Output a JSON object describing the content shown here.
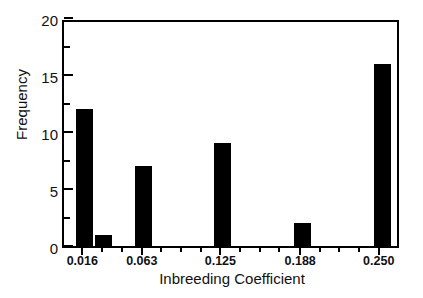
{
  "chart_data": {
    "type": "bar",
    "title": "",
    "xlabel": "Inbreeding Coefficient",
    "ylabel": "Frequency",
    "categories": [
      "0.016",
      "0.031",
      "0.063",
      "0.125",
      "0.188",
      "0.250"
    ],
    "values": [
      12,
      1,
      7,
      9,
      2,
      16
    ],
    "x": [
      0.016,
      0.031,
      0.063,
      0.125,
      0.188,
      0.25
    ],
    "bar_color": "#000000",
    "background_color": "#ffffff",
    "grid": false,
    "legend": "none",
    "xlim": [
      0.0,
      0.266
    ],
    "ylim": [
      0,
      20
    ],
    "y_ticks": [
      0,
      5,
      10,
      15,
      20
    ],
    "y_tick_labels": [
      "0",
      "5",
      "10",
      "15",
      "20"
    ],
    "y_minor_ticks": [
      2.5,
      7.5,
      12.5,
      17.5
    ],
    "x_ticks": [
      0.016,
      0.063,
      0.125,
      0.188,
      0.25
    ],
    "x_tick_labels": [
      "0.016",
      "0.063",
      "0.125",
      "0.188",
      "0.250"
    ],
    "x_minor_ticks": [
      0.0315,
      0.047,
      0.0785,
      0.094,
      0.1095,
      0.1405,
      0.156,
      0.1715,
      0.2035,
      0.219,
      0.2345
    ],
    "bars": [
      {
        "label": "0.016",
        "value": 12,
        "center": 0.016
      },
      {
        "label": "0.031",
        "value": 1,
        "center": 0.0315
      },
      {
        "label": "0.063",
        "value": 7,
        "center": 0.063
      },
      {
        "label": "0.125",
        "value": 9,
        "center": 0.125
      },
      {
        "label": "0.188",
        "value": 2,
        "center": 0.188
      },
      {
        "label": "0.250",
        "value": 16,
        "center": 0.2515
      }
    ]
  },
  "axes": {
    "y_title": "Frequency",
    "x_title": "Inbreeding Coefficient"
  }
}
